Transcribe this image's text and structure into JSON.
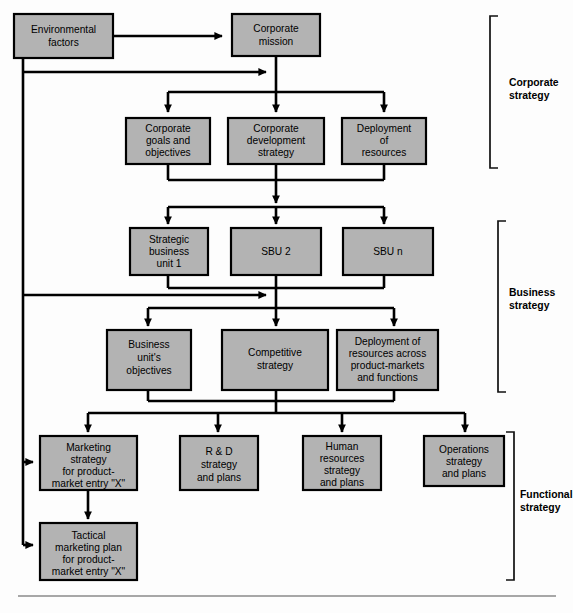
{
  "diagram": {
    "background_color": "#fdfdfd",
    "node_fill_color": "#b3b3b3",
    "node_border_color": "#000000",
    "connector_color": "#000000"
  },
  "nodes": {
    "environmental_factors": {
      "lines": [
        "Environmental",
        "factors"
      ]
    },
    "corporate_mission": {
      "lines": [
        "Corporate",
        "mission"
      ]
    },
    "corporate_goals": {
      "lines": [
        "Corporate",
        "goals and",
        "objectives"
      ]
    },
    "corporate_development": {
      "lines": [
        "Corporate",
        "development",
        "strategy"
      ]
    },
    "deployment_resources": {
      "lines": [
        "Deployment",
        "of",
        "resources"
      ]
    },
    "sbu_1": {
      "lines": [
        "Strategic",
        "business",
        "unit 1"
      ]
    },
    "sbu_2": {
      "lines": [
        "SBU 2"
      ]
    },
    "sbu_n": {
      "lines": [
        "SBU n"
      ]
    },
    "business_unit_objectives": {
      "lines": [
        "Business",
        "unit's",
        "objectives"
      ]
    },
    "competitive_strategy": {
      "lines": [
        "Competitive",
        "strategy"
      ]
    },
    "deployment_across": {
      "lines": [
        "Deployment of",
        "resources across",
        "product-markets",
        "and functions"
      ]
    },
    "marketing_strategy": {
      "lines": [
        "Marketing",
        "strategy",
        "for product-",
        "market entry \"X\""
      ]
    },
    "rd_strategy": {
      "lines": [
        "R & D",
        "strategy",
        "and plans"
      ]
    },
    "human_resources": {
      "lines": [
        "Human",
        "resources",
        "strategy",
        "and plans"
      ]
    },
    "operations_strategy": {
      "lines": [
        "Operations",
        "strategy",
        "and plans"
      ]
    },
    "tactical_marketing": {
      "lines": [
        "Tactical",
        "marketing plan",
        "for product-",
        "market entry \"X\""
      ]
    }
  },
  "brackets": {
    "corporate": {
      "lines": [
        "Corporate",
        "strategy"
      ]
    },
    "business": {
      "lines": [
        "Business",
        "strategy"
      ]
    },
    "functional": {
      "lines": [
        "Functional",
        "strategy"
      ]
    }
  }
}
